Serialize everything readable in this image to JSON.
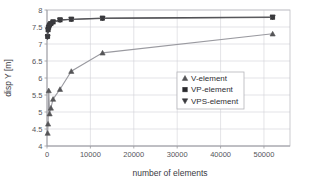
{
  "chart_data": {
    "type": "line",
    "title": "",
    "xlabel": "number of elements",
    "ylabel": "disp Y [m]",
    "xlim": [
      0,
      56000
    ],
    "ylim": [
      4,
      8
    ],
    "grid": true,
    "legend_position": "center-right",
    "x_ticks": [
      "0",
      "10000",
      "20000",
      "30000",
      "40000",
      "50000"
    ],
    "x_tick_values": [
      0,
      10000,
      20000,
      30000,
      40000,
      50000
    ],
    "y_ticks": [
      "4",
      "4.5",
      "5",
      "5.5",
      "6",
      "6.5",
      "7",
      "7.5",
      "8"
    ],
    "y_tick_values": [
      4,
      4.5,
      5,
      5.5,
      6,
      6.5,
      7,
      7.5,
      8
    ],
    "series": [
      {
        "name": "V-element",
        "marker": "triangle-up",
        "color": "#555558",
        "line_color": "#9a9aa0",
        "x": [
          150,
          250,
          400,
          600,
          900,
          1400,
          3000,
          5600,
          12800,
          52000
        ],
        "y": [
          4.38,
          4.65,
          5.63,
          4.95,
          5.12,
          5.38,
          5.67,
          6.2,
          6.74,
          7.3
        ]
      },
      {
        "name": "VP-element",
        "marker": "square",
        "color": "#2a2a2d",
        "line_color": "#4a4a4e",
        "x": [
          150,
          250,
          400,
          600,
          900,
          1400,
          3000,
          5600,
          12800,
          52000
        ],
        "y": [
          7.22,
          7.42,
          7.5,
          7.56,
          7.6,
          7.65,
          7.71,
          7.73,
          7.76,
          7.79
        ]
      },
      {
        "name": "VPS-element",
        "marker": "triangle-down",
        "color": "#3a3a3e",
        "line_color": "#5a5a5e",
        "x": [
          150,
          250,
          400,
          600,
          900,
          1400,
          3000,
          5600,
          12800,
          52000
        ],
        "y": [
          7.2,
          7.4,
          7.48,
          7.54,
          7.59,
          7.64,
          7.7,
          7.72,
          7.75,
          7.78
        ]
      }
    ]
  },
  "legend": {
    "items": [
      {
        "label": "V-element",
        "marker": "triangle-up-icon"
      },
      {
        "label": "VP-element",
        "marker": "square-icon"
      },
      {
        "label": "VPS-element",
        "marker": "triangle-down-icon"
      }
    ]
  }
}
